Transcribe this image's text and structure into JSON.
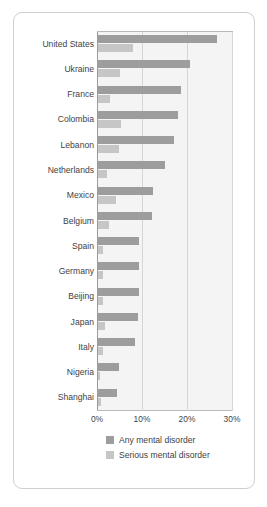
{
  "chart_data": {
    "type": "bar",
    "orientation": "horizontal",
    "title": "",
    "subtitle": "",
    "xlabel": "",
    "ylabel": "",
    "xlim": [
      0,
      30
    ],
    "xticks": [
      "0%",
      "10%",
      "20%",
      "30%"
    ],
    "xtick_values": [
      0,
      10,
      20,
      30
    ],
    "grid": true,
    "legend_position": "bottom",
    "categories": [
      "United States",
      "Ukraine",
      "France",
      "Colombia",
      "Lebanon",
      "Netherlands",
      "Mexico",
      "Belgium",
      "Spain",
      "Germany",
      "Beijing",
      "Japan",
      "Italy",
      "Nigeria",
      "Shanghai"
    ],
    "series": [
      {
        "name": "Any mental disorder",
        "color": "#9d9d9d",
        "values": [
          26.4,
          20.5,
          18.4,
          17.8,
          16.9,
          14.9,
          12.2,
          12.0,
          9.2,
          9.1,
          9.1,
          8.8,
          8.2,
          4.7,
          4.3
        ]
      },
      {
        "name": "Serious mental disorder",
        "color": "#c6c6c6",
        "values": [
          7.7,
          4.8,
          2.7,
          5.2,
          4.6,
          1.9,
          3.9,
          2.4,
          1.0,
          1.2,
          1.1,
          1.5,
          1.0,
          0.4,
          0.6
        ]
      }
    ]
  },
  "legend": {
    "items": [
      {
        "label": "Any mental disorder",
        "color": "#9d9d9d"
      },
      {
        "label": "Serious mental disorder",
        "color": "#c6c6c6"
      }
    ]
  }
}
